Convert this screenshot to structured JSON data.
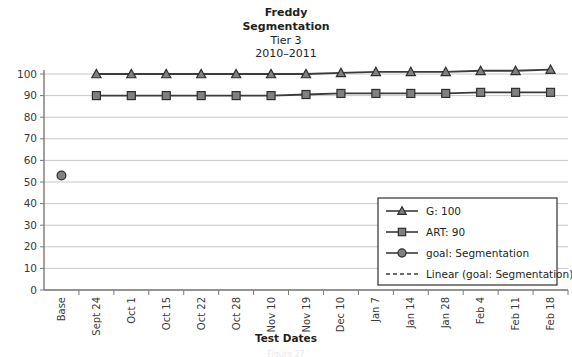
{
  "chart_data": {
    "type": "line",
    "title_lines": [
      {
        "text": "Freddy",
        "bold": true
      },
      {
        "text": "Segmentation",
        "bold": true
      },
      {
        "text": "Tier 3",
        "bold": false
      },
      {
        "text": "2010–2011",
        "bold": false
      }
    ],
    "xlabel": "Test Dates",
    "ylabel": "",
    "ylim": [
      0,
      100
    ],
    "ytick_step": 10,
    "yticks": [
      0,
      10,
      20,
      30,
      40,
      50,
      60,
      70,
      80,
      90,
      100
    ],
    "grid": true,
    "legend_position": "lower-right",
    "categories": [
      "Base",
      "Sept 24",
      "Oct 1",
      "Oct 15",
      "Oct 22",
      "Oct 28",
      "Nov 10",
      "Nov 19",
      "Dec 10",
      "Jan 7",
      "Jan 14",
      "Jan 28",
      "Feb 4",
      "Feb 11",
      "Feb 18"
    ],
    "series": [
      {
        "name": "G: 100",
        "marker": "triangle",
        "values": [
          null,
          100,
          100,
          100,
          100,
          100,
          100,
          100,
          100.5,
          101,
          101,
          101,
          101.5,
          101.5,
          102
        ]
      },
      {
        "name": "ART: 90",
        "marker": "square",
        "values": [
          null,
          90,
          90,
          90,
          90,
          90,
          90,
          90.5,
          91,
          91,
          91,
          91,
          91.5,
          91.5,
          91.5
        ]
      },
      {
        "name": "goal: Segmentation",
        "marker": "circle",
        "values": [
          53,
          null,
          null,
          null,
          null,
          null,
          null,
          null,
          null,
          null,
          null,
          null,
          null,
          null,
          null
        ]
      }
    ],
    "legend": [
      {
        "label": "G: 100",
        "marker": "triangle",
        "line": "solid"
      },
      {
        "label": "ART: 90",
        "marker": "square",
        "line": "solid"
      },
      {
        "label": "goal: Segmentation",
        "marker": "circle",
        "line": "solid"
      },
      {
        "label": "Linear (goal: Segmentation)",
        "marker": "none",
        "line": "dashed"
      }
    ],
    "colors": {
      "marker_fill": "#808080",
      "marker_stroke": "#2f2f2f",
      "series_line": "#3b3b3b",
      "gridline": "#c8c8c8",
      "axis": "#7a7a7a",
      "text": "#231f20"
    }
  },
  "footer": {
    "cropped_caption": "Figure 27"
  }
}
